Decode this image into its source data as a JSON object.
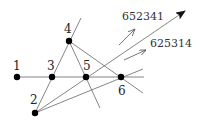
{
  "diagram": {
    "points": [
      {
        "id": "1",
        "label": "1",
        "x": 17,
        "y": 77,
        "label_x": 13,
        "label_y": 70
      },
      {
        "id": "2",
        "label": "2",
        "x": 35,
        "y": 113,
        "label_x": 30,
        "label_y": 104
      },
      {
        "id": "3",
        "label": "3",
        "x": 52,
        "y": 77,
        "label_x": 47,
        "label_y": 70
      },
      {
        "id": "4",
        "label": "4",
        "x": 69,
        "y": 41,
        "label_x": 64,
        "label_y": 33
      },
      {
        "id": "5",
        "label": "5",
        "x": 86,
        "y": 77,
        "label_x": 83,
        "label_y": 70
      },
      {
        "id": "6",
        "label": "6",
        "x": 121,
        "y": 77,
        "label_x": 118,
        "label_y": 95
      }
    ],
    "lines": [
      {
        "name": "horizontal-line-1-3-5-6",
        "x1": 17,
        "y1": 77,
        "x2": 144,
        "y2": 77
      },
      {
        "name": "line-2-3-4",
        "x1": 35,
        "y1": 113,
        "x2": 81,
        "y2": 18
      },
      {
        "name": "line-4-5",
        "x1": 69,
        "y1": 41,
        "x2": 100,
        "y2": 108
      },
      {
        "name": "line-4-6",
        "x1": 69,
        "y1": 41,
        "x2": 143,
        "y2": 93
      },
      {
        "name": "line-2-6",
        "x1": 35,
        "y1": 113,
        "x2": 143,
        "y2": 69
      },
      {
        "name": "line-2-5-arrow",
        "x1": 35,
        "y1": 113,
        "x2": 185,
        "y2": 11
      }
    ],
    "main_arrow": {
      "tip_x": 185,
      "tip_y": 11
    },
    "small_arrows": [
      {
        "name": "arrow-652341",
        "x1": 119,
        "y1": 45,
        "x2": 135,
        "y2": 29
      },
      {
        "name": "arrow-625314",
        "x1": 124,
        "y1": 60,
        "x2": 146,
        "y2": 50
      }
    ],
    "permutation_labels": [
      {
        "name": "permutation-label-652341",
        "text": "652341",
        "x": 122,
        "y": 20
      },
      {
        "name": "permutation-label-625314",
        "text": "625314",
        "x": 150,
        "y": 47
      }
    ]
  }
}
